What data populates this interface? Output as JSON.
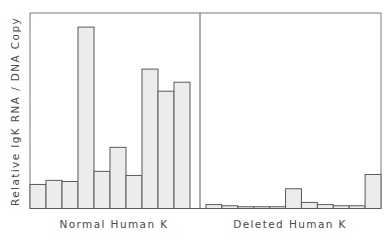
{
  "chart_data": {
    "type": "bar",
    "title": "",
    "ylabel": "Relative IgK RNA / DNA Copy",
    "xlabel": "",
    "ylim": [
      0,
      100
    ],
    "y_units": "relative (no ticks shown)",
    "grid": false,
    "legend": null,
    "bar_fill": "#ececec",
    "bar_stroke": "#5a5a5a",
    "panels": [
      {
        "name": "Normal Human K",
        "label": "Normal Human K",
        "values": [
          12.3,
          14.4,
          13.8,
          92.8,
          19.0,
          31.3,
          16.9,
          71.3,
          60.0,
          64.6
        ]
      },
      {
        "name": "Deleted Human K",
        "label": "Deleted Human K",
        "values": [
          2.0,
          1.4,
          0.9,
          0.9,
          0.9,
          10.1,
          3.1,
          2.0,
          1.4,
          1.4,
          17.4
        ]
      }
    ]
  }
}
